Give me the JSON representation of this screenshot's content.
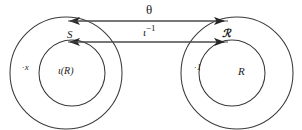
{
  "figure": {
    "type": "commutative-diagram",
    "background_color": "#ffffff",
    "ink_color": "#262626",
    "width": 302,
    "height": 130
  },
  "labels": {
    "top_arrow": "θ",
    "bottom_arrow_base": "ι",
    "bottom_arrow_exponent": "−1",
    "left_outer_region": "S",
    "left_inner_region": "ι(R)",
    "right_outer_region": "ℛ",
    "right_inner_region": "R",
    "left_margin_mark": "·x",
    "right_margin_mark": "·1"
  },
  "shapes": {
    "left_outer_circle": {
      "cx": 66,
      "cy": 73,
      "r": 56
    },
    "left_inner_circle": {
      "cx": 72,
      "cy": 73,
      "r": 33
    },
    "right_outer_circle": {
      "cx": 237,
      "cy": 73,
      "r": 56
    },
    "right_inner_circle": {
      "cx": 232,
      "cy": 73,
      "r": 33
    },
    "top_arrow": {
      "x1": 66,
      "x2": 228,
      "y": 21,
      "heads": "both"
    },
    "bottom_arrow": {
      "x1": 66,
      "x2": 228,
      "y": 42,
      "heads": "both"
    }
  }
}
